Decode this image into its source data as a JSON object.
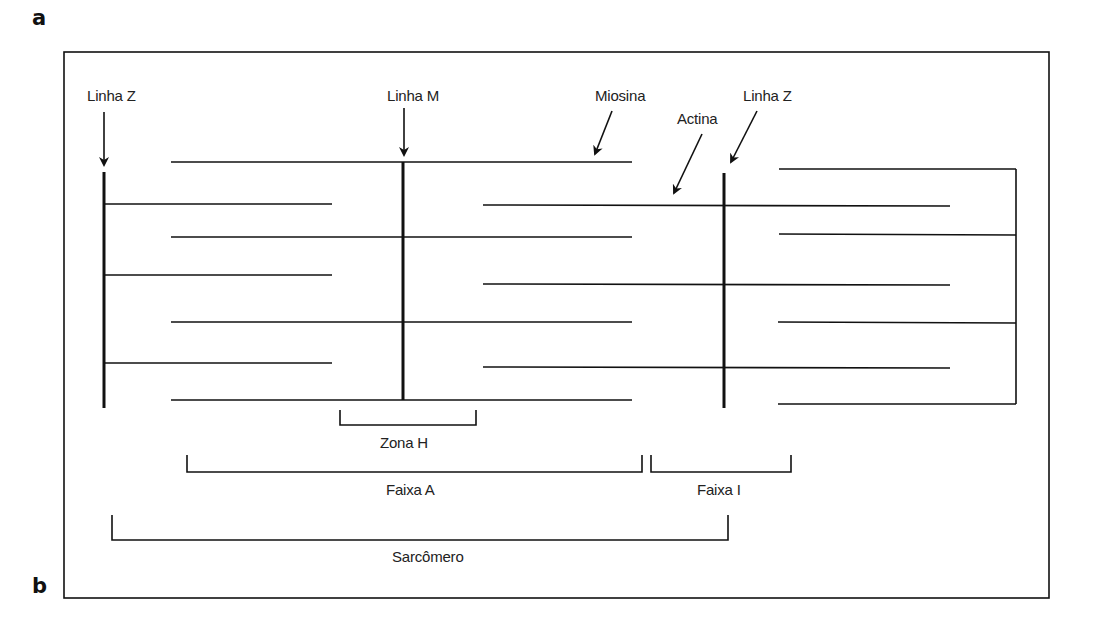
{
  "panels": {
    "a": "a",
    "b": "b"
  },
  "labels": {
    "z_line_left": "Linha Z",
    "m_line": "Linha M",
    "myosin": "Miosina",
    "actin": "Actina",
    "z_line_right": "Linha Z",
    "h_zone": "Zona H",
    "a_band": "Faixa A",
    "i_band": "Faixa I",
    "sarcomere": "Sarcômero"
  },
  "colors": {
    "line": "#111111",
    "text": "#222222",
    "background": "#ffffff"
  }
}
